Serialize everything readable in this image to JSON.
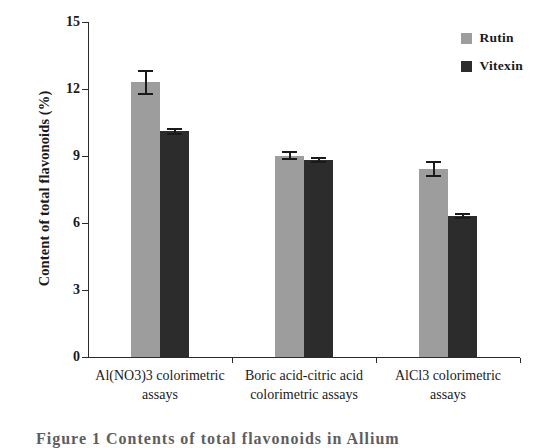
{
  "chart_data": {
    "type": "bar",
    "title": "",
    "xlabel": "",
    "ylabel": "Content of total flavonoids (%)",
    "ylim": [
      0,
      15
    ],
    "yticks": [
      0,
      3,
      6,
      9,
      12,
      15
    ],
    "ytick_labels": [
      "0",
      "3",
      "6",
      "9",
      "12",
      "15"
    ],
    "grid": false,
    "legend_position": "top-right",
    "categories": [
      "Al(NO3)3 colorimetric\nassays",
      "Boric acid-citric acid\ncolorimetric assays",
      "AlCl3 colorimetric\nassays"
    ],
    "series": [
      {
        "name": "Rutin",
        "color": "#9d9d9d",
        "values": [
          12.3,
          9.0,
          8.4
        ],
        "errors": [
          0.55,
          0.2,
          0.35
        ]
      },
      {
        "name": "Vitexin",
        "color": "#2c2c2c",
        "values": [
          10.1,
          8.8,
          6.3
        ],
        "errors": [
          0.15,
          0.13,
          0.15
        ]
      }
    ]
  },
  "legend": {
    "items": [
      {
        "label": "Rutin",
        "color": "#9d9d9d"
      },
      {
        "label": "Vitexin",
        "color": "#2c2c2c"
      }
    ]
  },
  "axes": {
    "y_title": "Content of total flavonoids (%)"
  },
  "caption": {
    "text": "Figure 1  Contents of total flavonoids in Allium"
  }
}
